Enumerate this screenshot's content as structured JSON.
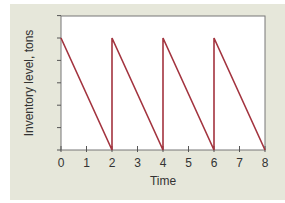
{
  "chart_data": {
    "type": "line",
    "title": "",
    "xlabel": "Time",
    "ylabel": "Inventory level, tons",
    "x_ticks": [
      0,
      1,
      2,
      3,
      4,
      5,
      6,
      7,
      8
    ],
    "y_ticks_count": 6,
    "y_tick_labels": [],
    "xlim": [
      0,
      8
    ],
    "ylim": [
      0,
      6
    ],
    "grid": false,
    "legend": null,
    "series": [
      {
        "name": "Inventory level",
        "color": "#a3343f",
        "points": [
          [
            0,
            5
          ],
          [
            2,
            0
          ],
          [
            2,
            5
          ],
          [
            4,
            0
          ],
          [
            4,
            5
          ],
          [
            6,
            0
          ],
          [
            6,
            5
          ],
          [
            8,
            0
          ]
        ]
      }
    ],
    "annotations": []
  },
  "colors": {
    "background": "#e6e7da",
    "plot_area": "#ffffff",
    "axis": "#555555",
    "line": "#a3343f"
  }
}
